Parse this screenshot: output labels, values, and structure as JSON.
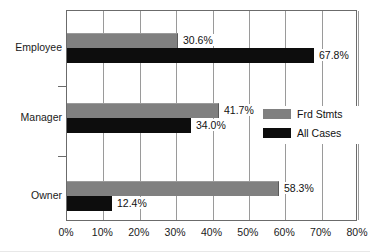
{
  "chart_data": {
    "type": "bar",
    "orientation": "horizontal",
    "title": "",
    "subtitle": "",
    "xlabel": "",
    "ylabel": "",
    "xlim": [
      0,
      80
    ],
    "xtick_labels": [
      "0%",
      "10%",
      "20%",
      "30%",
      "40%",
      "50%",
      "60%",
      "70%",
      "80%"
    ],
    "xtick_values": [
      0,
      10,
      20,
      30,
      40,
      50,
      60,
      70,
      80
    ],
    "grid": true,
    "grid_axis": "x",
    "legend_position": "inside-right-middle",
    "categories": [
      "Employee",
      "Manager",
      "Owner"
    ],
    "series": [
      {
        "name": "Frd Stmts",
        "color": "#808080",
        "values": [
          30.6,
          41.7,
          58.3
        ],
        "labels": [
          "30.6%",
          "41.7%",
          "58.3%"
        ]
      },
      {
        "name": "All Cases",
        "color": "#0d0d0d",
        "values": [
          67.8,
          34.0,
          12.4
        ],
        "labels": [
          "67.8%",
          "34.0%",
          "12.4%"
        ]
      }
    ]
  },
  "legend": {
    "items": [
      {
        "label": "Frd Stmts",
        "color": "#808080"
      },
      {
        "label": "All Cases",
        "color": "#0d0d0d"
      }
    ]
  },
  "axis": {
    "x_ticks": [
      "0%",
      "10%",
      "20%",
      "30%",
      "40%",
      "50%",
      "60%",
      "70%",
      "80%"
    ],
    "y_categories": [
      "Employee",
      "Manager",
      "Owner"
    ]
  },
  "colors": {
    "series_frd_stmts": "#808080",
    "series_all_cases": "#0d0d0d",
    "frame": "#6b6b6b",
    "gridline": "#9a9a9a",
    "text": "#111111",
    "background": "#ffffff"
  }
}
